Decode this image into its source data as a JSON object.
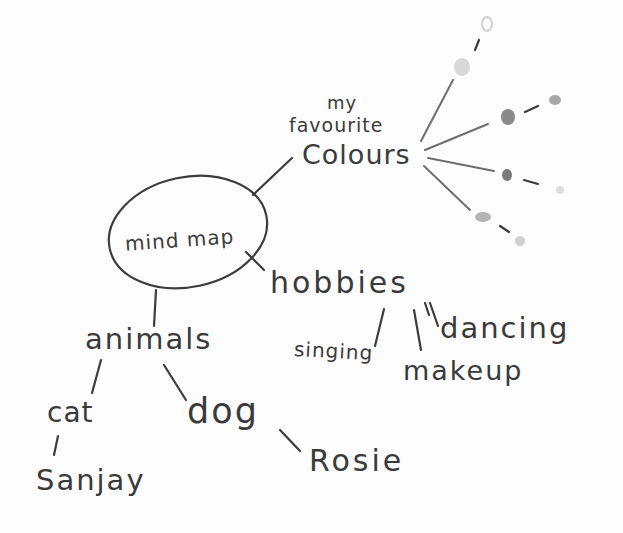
{
  "diagram": {
    "type": "mind-map",
    "style": "hand-drawn pencil",
    "center": {
      "label": "mind map"
    },
    "branches": [
      {
        "label": "my favourite Colours",
        "label_lines": [
          "my",
          "favourite",
          "Colours"
        ],
        "children": [
          {
            "label": "",
            "dots": [
              "#d8d8d8",
              "#e6e6e6"
            ]
          },
          {
            "label": "",
            "dots": [
              "#8a8a8a",
              "#a8a8a8"
            ]
          },
          {
            "label": "",
            "dots": [
              "#7a7a7a",
              "#dcdcdc"
            ]
          },
          {
            "label": "",
            "dots": [
              "#b4b4b4",
              "#cfcfcf"
            ]
          }
        ]
      },
      {
        "label": "hobbies",
        "children": [
          {
            "label": "singing"
          },
          {
            "label": "makeup"
          },
          {
            "label": "dancing"
          }
        ]
      },
      {
        "label": "animals",
        "children": [
          {
            "label": "cat",
            "children": [
              {
                "label": "Sanjay"
              }
            ]
          },
          {
            "label": "dog",
            "children": [
              {
                "label": "Rosie"
              }
            ]
          }
        ]
      }
    ]
  },
  "colors": {
    "pencil": "#3c3c3c",
    "paper": "#fdfdfd"
  }
}
